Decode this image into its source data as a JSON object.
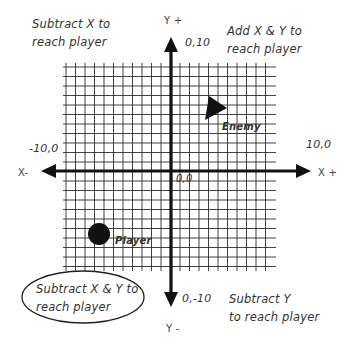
{
  "diagram": {
    "title": "",
    "axes": {
      "x_positive_label": "X +",
      "x_negative_label": "X-",
      "y_positive_label": "Y +",
      "y_negative_label": "Y -"
    },
    "coordinate_labels": {
      "origin": "0,0",
      "top": "0,10",
      "bottom": "0,-10",
      "left": "-10,0",
      "right": "10,0"
    },
    "quadrant_notes": {
      "top_left": [
        "Subtract X to",
        "reach player"
      ],
      "top_right": [
        "Add X & Y to",
        "reach player"
      ],
      "bottom_left": [
        "Subtract X & Y to",
        "reach player"
      ],
      "bottom_right": [
        "Subtract Y",
        "to reach player"
      ]
    },
    "entities": {
      "enemy": {
        "label": "Enemy",
        "shape": "triangle",
        "color": "#111111"
      },
      "player": {
        "label": "Player",
        "shape": "circle",
        "color": "#111111"
      }
    },
    "colors": {
      "grid": "#333333",
      "axis": "#111111",
      "text": "#333333",
      "background": "#ffffff"
    }
  }
}
